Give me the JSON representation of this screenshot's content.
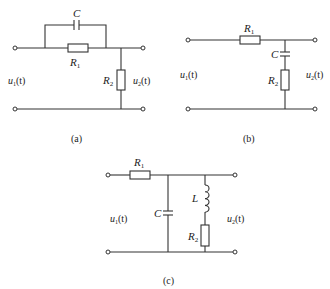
{
  "figure": {
    "panels": [
      {
        "id": "a",
        "caption": "(a)",
        "input_label": {
          "main": "u",
          "sub": "1",
          "arg": "(t)"
        },
        "output_label": {
          "main": "u",
          "sub": "2",
          "arg": "(t)"
        },
        "components": [
          {
            "type": "capacitor",
            "label": "C",
            "position": "parallel with R1, series path"
          },
          {
            "type": "resistor",
            "label": "R",
            "sub": "1",
            "position": "series"
          },
          {
            "type": "resistor",
            "label": "R",
            "sub": "2",
            "position": "shunt"
          }
        ]
      },
      {
        "id": "b",
        "caption": "(b)",
        "input_label": {
          "main": "u",
          "sub": "1",
          "arg": "(t)"
        },
        "output_label": {
          "main": "u",
          "sub": "2",
          "arg": "(t)"
        },
        "components": [
          {
            "type": "resistor",
            "label": "R",
            "sub": "1",
            "position": "series"
          },
          {
            "type": "capacitor",
            "label": "C",
            "position": "shunt, in series with R2"
          },
          {
            "type": "resistor",
            "label": "R",
            "sub": "2",
            "position": "shunt"
          }
        ]
      },
      {
        "id": "c",
        "caption": "(c)",
        "input_label": {
          "main": "u",
          "sub": "1",
          "arg": "(t)"
        },
        "output_label": {
          "main": "u",
          "sub": "2",
          "arg": "(t)"
        },
        "components": [
          {
            "type": "resistor",
            "label": "R",
            "sub": "1",
            "position": "series"
          },
          {
            "type": "capacitor",
            "label": "C",
            "position": "shunt"
          },
          {
            "type": "inductor",
            "label": "L",
            "position": "shunt, in series with R2"
          },
          {
            "type": "resistor",
            "label": "R",
            "sub": "2",
            "position": "shunt"
          }
        ]
      }
    ]
  }
}
